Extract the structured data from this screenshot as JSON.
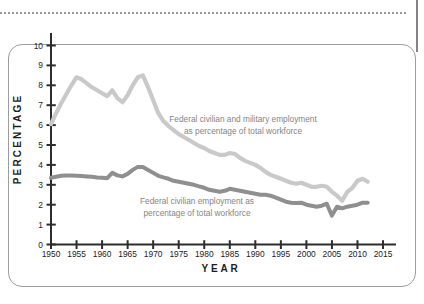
{
  "figure": {
    "background": "#ffffff",
    "frame_border_color": "#9c9c9c",
    "top_dotted_rule_color": "#979797",
    "right_rule_color": "#848484",
    "axis_color": "#2d2d2d",
    "tick_label_color": "#222222"
  },
  "chart_data": {
    "type": "line",
    "title": "",
    "xlabel": "YEAR",
    "ylabel": "PERCENTAGE",
    "grid": false,
    "legend_position": "inline-annotations",
    "xlim": [
      1950,
      2017
    ],
    "ylim": [
      0,
      10.6
    ],
    "x_ticks": [
      1950,
      1955,
      1960,
      1965,
      1970,
      1975,
      1980,
      1985,
      1990,
      1995,
      2000,
      2005,
      2010,
      2015
    ],
    "y_ticks": [
      0,
      1,
      2,
      3,
      4,
      5,
      6,
      7,
      8,
      9,
      10
    ],
    "x": [
      1950,
      1951,
      1952,
      1953,
      1954,
      1955,
      1956,
      1957,
      1958,
      1959,
      1960,
      1961,
      1962,
      1963,
      1964,
      1965,
      1966,
      1967,
      1968,
      1969,
      1970,
      1971,
      1972,
      1973,
      1974,
      1975,
      1976,
      1977,
      1978,
      1979,
      1980,
      1981,
      1982,
      1983,
      1984,
      1985,
      1986,
      1987,
      1988,
      1989,
      1990,
      1991,
      1992,
      1993,
      1994,
      1995,
      1996,
      1997,
      1998,
      1999,
      2000,
      2001,
      2002,
      2003,
      2004,
      2005,
      2006,
      2007,
      2008,
      2009,
      2010,
      2011,
      2012
    ],
    "series": [
      {
        "name": "Federal civilian and military employment as percentage of total workforce",
        "color": "#c9c9c9",
        "stroke_width": 4.2,
        "values": [
          6.05,
          6.6,
          7.1,
          7.55,
          8.0,
          8.4,
          8.3,
          8.1,
          7.9,
          7.75,
          7.6,
          7.45,
          7.75,
          7.35,
          7.15,
          7.5,
          8.0,
          8.4,
          8.5,
          7.9,
          7.25,
          6.6,
          6.2,
          5.95,
          5.75,
          5.55,
          5.4,
          5.25,
          5.1,
          4.95,
          4.85,
          4.7,
          4.6,
          4.5,
          4.5,
          4.6,
          4.55,
          4.35,
          4.2,
          4.1,
          4.0,
          3.85,
          3.65,
          3.5,
          3.4,
          3.3,
          3.2,
          3.1,
          3.05,
          3.1,
          3.0,
          2.9,
          2.9,
          2.95,
          2.9,
          2.65,
          2.45,
          2.2,
          2.65,
          2.85,
          3.2,
          3.3,
          3.15
        ]
      },
      {
        "name": "Federal civilian employment as percentage of total workforce",
        "color": "#8f8f8f",
        "stroke_width": 4.0,
        "values": [
          3.35,
          3.4,
          3.45,
          3.47,
          3.46,
          3.45,
          3.44,
          3.42,
          3.4,
          3.37,
          3.35,
          3.33,
          3.6,
          3.47,
          3.42,
          3.55,
          3.75,
          3.9,
          3.9,
          3.75,
          3.6,
          3.45,
          3.37,
          3.3,
          3.2,
          3.15,
          3.1,
          3.05,
          3.0,
          2.92,
          2.85,
          2.75,
          2.7,
          2.65,
          2.7,
          2.8,
          2.75,
          2.7,
          2.65,
          2.6,
          2.55,
          2.5,
          2.5,
          2.45,
          2.35,
          2.25,
          2.15,
          2.1,
          2.08,
          2.1,
          2.0,
          1.95,
          1.9,
          1.95,
          2.05,
          1.45,
          1.9,
          1.82,
          1.9,
          1.95,
          2.0,
          2.1,
          2.1
        ]
      }
    ],
    "annotations": [
      {
        "text_lines": [
          "Federal civilian and military employment",
          "as percentage of total workforce"
        ],
        "anchor_x": 243,
        "anchor_y": 122,
        "color": "#858585"
      },
      {
        "text_lines": [
          "Federal civilian employment as",
          "percentage of total workforce"
        ],
        "anchor_x": 197,
        "anchor_y": 204,
        "color": "#858585"
      }
    ]
  }
}
